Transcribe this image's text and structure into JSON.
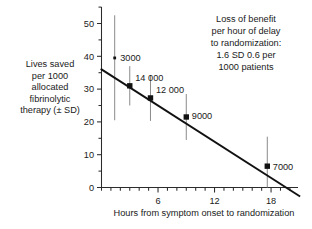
{
  "chart_data": {
    "type": "scatter",
    "title": "",
    "xlabel": "Hours from symptom onset to randomization",
    "ylabel": "Lives saved per 1000 allocated fibrinolytic therapy (± SD)",
    "ylabel_lines": [
      "Lives saved",
      "per 1000",
      "allocated",
      "fibrinolytic",
      "therapy (± SD)"
    ],
    "xlim": [
      0,
      21
    ],
    "ylim": [
      0,
      55
    ],
    "x_ticks": [
      6,
      12,
      18
    ],
    "x_tick_labels": [
      "6",
      "12",
      "18"
    ],
    "x_minor_tick_step": 1,
    "y_ticks": [
      0,
      10,
      20,
      30,
      40,
      50
    ],
    "y_tick_labels": [
      "0",
      "10",
      "20",
      "30",
      "40",
      "50"
    ],
    "y_minor_tick_step": 5,
    "grid": false,
    "legend": false,
    "points": [
      {
        "label": "3000",
        "x": 1.4,
        "y": 39.5,
        "err_low": 19.0,
        "err_high": 13.0,
        "marker_size": "small"
      },
      {
        "label": "14 000",
        "x": 3.0,
        "y": 31.0,
        "err_low": 6.0,
        "err_high": 6.0,
        "marker_size": "large"
      },
      {
        "label": "12 000",
        "x": 5.2,
        "y": 27.3,
        "err_low": 7.0,
        "err_high": 7.0,
        "marker_size": "large"
      },
      {
        "label": "9000",
        "x": 9.0,
        "y": 21.5,
        "err_low": 7.0,
        "err_high": 7.0,
        "marker_size": "large"
      },
      {
        "label": "7000",
        "x": 17.6,
        "y": 6.5,
        "err_low": 6.5,
        "err_high": 9.0,
        "marker_size": "large"
      }
    ],
    "fit_line": {
      "x_start": 0.0,
      "y_start": 36.0,
      "x_end": 21.0,
      "y_end": -2.6
    },
    "annotation": {
      "text": "Loss of benefit per hour of delay to randomization: 1.6 SD 0.6 per 1000 patients",
      "lines": [
        "Loss of benefit",
        "per hour of delay",
        "to randomization:",
        "1.6 SD 0.6 per",
        "1000 patients"
      ]
    },
    "colors": {
      "axis": "#2b2b2b",
      "fit_line": "#111111",
      "marker": "#111111",
      "error_bar": "#8a8a8a",
      "text": "#1a1a1a",
      "background": "#ffffff"
    }
  }
}
